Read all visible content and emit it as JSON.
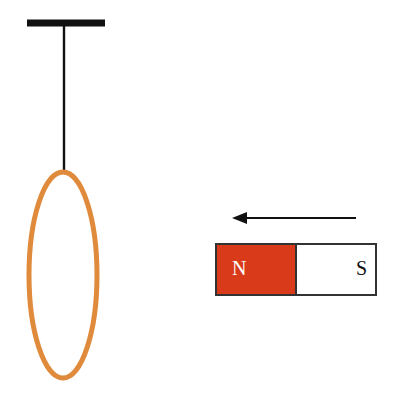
{
  "figure": {
    "background_color": "#ffffff",
    "width": 395,
    "height": 397
  },
  "support": {
    "name": "ceiling support bar",
    "color": "#111111",
    "x1": 27,
    "x2": 105,
    "y": 23,
    "thickness": 7
  },
  "string": {
    "name": "suspension string",
    "color": "#111111",
    "x": 64,
    "y1": 23,
    "y2": 173,
    "thickness": 2.4
  },
  "ring": {
    "name": "conducting ring",
    "color": "#E08A3C",
    "stroke_width": 5,
    "center_x": 63,
    "center_y": 275,
    "radius_x": 34,
    "radius_y": 103
  },
  "arrow": {
    "name": "motion direction arrow",
    "color": "#111111",
    "direction": "left",
    "tail_x": 356,
    "tip_x": 232,
    "y": 218,
    "shaft_thickness": 2,
    "head_length": 15,
    "head_half_height": 6
  },
  "magnet": {
    "name": "bar magnet",
    "x": 216,
    "y": 244,
    "width": 160,
    "height": 51,
    "border_color": "#333333",
    "border_width": 2,
    "divider_x": 296,
    "north": {
      "label": "N",
      "fill_color": "#D93A1A",
      "label_color": "#ffffff",
      "label_x": 232,
      "label_y": 270
    },
    "south": {
      "label": "S",
      "fill_color": "#ffffff",
      "label_color": "#111111",
      "label_x": 356,
      "label_y": 270
    }
  }
}
